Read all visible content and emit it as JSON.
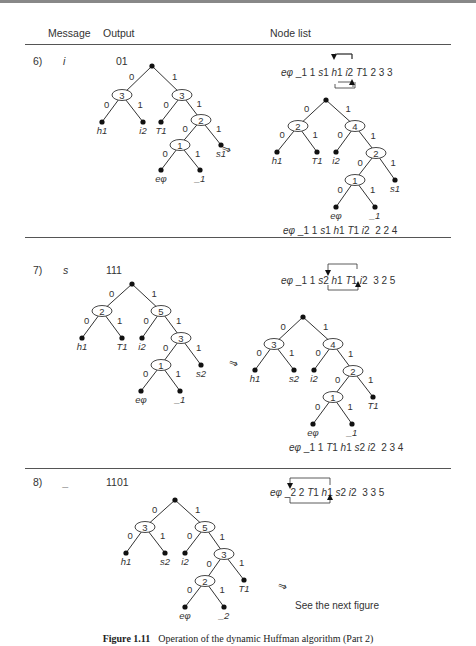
{
  "header": {
    "message": "Message",
    "output": "Output",
    "node_list": "Node list"
  },
  "steps": [
    {
      "number": "6)",
      "message": "i",
      "output": "01",
      "node_list_before": "eφ _1 1 s1 h1 i2 T1 2 3 3",
      "node_list_after": "eφ _1 1 s1 h1 T1 i2  2 2 4",
      "swap": [
        "i2",
        "T1"
      ],
      "tree_before": {
        "root": {
          "x": 152,
          "y": 66
        },
        "internal": [
          {
            "x": 122,
            "y": 95,
            "weight": "3"
          },
          {
            "x": 182,
            "y": 95,
            "weight": "3"
          },
          {
            "x": 201,
            "y": 120,
            "weight": "2"
          },
          {
            "x": 180,
            "y": 145,
            "weight": "1"
          }
        ],
        "leaves": [
          {
            "x": 102,
            "y": 122,
            "label": "h1"
          },
          {
            "x": 143,
            "y": 122,
            "label": "i2"
          },
          {
            "x": 161,
            "y": 122,
            "label": "T1"
          },
          {
            "x": 221,
            "y": 145,
            "label": "s1"
          },
          {
            "x": 161,
            "y": 170,
            "label": "eφ"
          },
          {
            "x": 200,
            "y": 170,
            "label": "_1"
          }
        ],
        "edges": [
          [
            152,
            66,
            122,
            95,
            "0"
          ],
          [
            152,
            66,
            182,
            95,
            "1"
          ],
          [
            122,
            95,
            102,
            122,
            "0"
          ],
          [
            122,
            95,
            143,
            122,
            "1"
          ],
          [
            182,
            95,
            161,
            122,
            "0"
          ],
          [
            182,
            95,
            201,
            120,
            "1"
          ],
          [
            201,
            120,
            180,
            145,
            "0"
          ],
          [
            201,
            120,
            221,
            145,
            "1"
          ],
          [
            180,
            145,
            161,
            170,
            "0"
          ],
          [
            180,
            145,
            200,
            170,
            "1"
          ]
        ]
      },
      "tree_after": {
        "root": {
          "x": 326,
          "y": 100
        },
        "internal": [
          {
            "x": 298,
            "y": 126,
            "weight": "2"
          },
          {
            "x": 355,
            "y": 126,
            "weight": "4"
          },
          {
            "x": 376,
            "y": 153,
            "weight": "2"
          },
          {
            "x": 355,
            "y": 180,
            "weight": "1"
          }
        ],
        "leaves": [
          {
            "x": 277,
            "y": 152,
            "label": "h1"
          },
          {
            "x": 317,
            "y": 152,
            "label": "T1"
          },
          {
            "x": 336,
            "y": 152,
            "label": "i2"
          },
          {
            "x": 395,
            "y": 180,
            "label": "s1"
          },
          {
            "x": 336,
            "y": 207,
            "label": "eφ"
          },
          {
            "x": 375,
            "y": 207,
            "label": "_1"
          }
        ],
        "edges": [
          [
            326,
            100,
            298,
            126,
            "0"
          ],
          [
            326,
            100,
            355,
            126,
            "1"
          ],
          [
            298,
            126,
            277,
            152,
            "0"
          ],
          [
            298,
            126,
            317,
            152,
            "1"
          ],
          [
            355,
            126,
            336,
            152,
            "0"
          ],
          [
            355,
            126,
            376,
            153,
            "1"
          ],
          [
            376,
            153,
            355,
            180,
            "0"
          ],
          [
            376,
            153,
            395,
            180,
            "1"
          ],
          [
            355,
            180,
            336,
            207,
            "0"
          ],
          [
            355,
            180,
            375,
            207,
            "1"
          ]
        ]
      }
    },
    {
      "number": "7)",
      "message": "s",
      "output": "111",
      "node_list_before": "eφ _1 1 s2 h1 T1 i2  3 2 5",
      "node_list_after": "eφ _1 1 T1 h1 s2 i2  2 3 4",
      "swap": [
        "s2",
        "T1"
      ],
      "tree_before": {
        "root": {
          "x": 132,
          "y": 284
        },
        "internal": [
          {
            "x": 102,
            "y": 311,
            "weight": "2"
          },
          {
            "x": 161,
            "y": 311,
            "weight": "5"
          },
          {
            "x": 181,
            "y": 338,
            "weight": "3"
          },
          {
            "x": 161,
            "y": 365,
            "weight": "1"
          }
        ],
        "leaves": [
          {
            "x": 82,
            "y": 338,
            "label": "h1"
          },
          {
            "x": 122,
            "y": 338,
            "label": "T1"
          },
          {
            "x": 142,
            "y": 338,
            "label": "i2"
          },
          {
            "x": 201,
            "y": 365,
            "label": "s2"
          },
          {
            "x": 141,
            "y": 391,
            "label": "eφ"
          },
          {
            "x": 180,
            "y": 391,
            "label": "_1"
          }
        ],
        "edges": [
          [
            132,
            284,
            102,
            311,
            "0"
          ],
          [
            132,
            284,
            161,
            311,
            "1"
          ],
          [
            102,
            311,
            82,
            338,
            "0"
          ],
          [
            102,
            311,
            122,
            338,
            "1"
          ],
          [
            161,
            311,
            142,
            338,
            "0"
          ],
          [
            161,
            311,
            181,
            338,
            "1"
          ],
          [
            181,
            338,
            161,
            365,
            "0"
          ],
          [
            181,
            338,
            201,
            365,
            "1"
          ],
          [
            161,
            365,
            141,
            391,
            "0"
          ],
          [
            161,
            365,
            180,
            391,
            "1"
          ]
        ]
      },
      "tree_after": {
        "root": {
          "x": 303,
          "y": 317
        },
        "internal": [
          {
            "x": 274,
            "y": 344,
            "weight": "3"
          },
          {
            "x": 333,
            "y": 344,
            "weight": "4"
          },
          {
            "x": 353,
            "y": 371,
            "weight": "2"
          },
          {
            "x": 333,
            "y": 397,
            "weight": "1"
          }
        ],
        "leaves": [
          {
            "x": 255,
            "y": 370,
            "label": "h1"
          },
          {
            "x": 294,
            "y": 370,
            "label": "s2"
          },
          {
            "x": 314,
            "y": 370,
            "label": "i2"
          },
          {
            "x": 373,
            "y": 397,
            "label": "T1"
          },
          {
            "x": 313,
            "y": 424,
            "label": "eφ"
          },
          {
            "x": 352,
            "y": 424,
            "label": "_1"
          }
        ],
        "edges": [
          [
            303,
            317,
            274,
            344,
            "0"
          ],
          [
            303,
            317,
            333,
            344,
            "1"
          ],
          [
            274,
            344,
            255,
            370,
            "0"
          ],
          [
            274,
            344,
            294,
            370,
            "1"
          ],
          [
            333,
            344,
            314,
            370,
            "0"
          ],
          [
            333,
            344,
            353,
            371,
            "1"
          ],
          [
            353,
            371,
            333,
            397,
            "0"
          ],
          [
            353,
            371,
            373,
            397,
            "1"
          ],
          [
            333,
            397,
            313,
            424,
            "0"
          ],
          [
            333,
            397,
            352,
            424,
            "1"
          ]
        ]
      }
    },
    {
      "number": "8)",
      "message": "_",
      "output": "1101",
      "node_list_before": "eφ _2 2 T1 h1 s2 i2  3 3 5",
      "swap": [
        "_2",
        "h1"
      ],
      "see_next": "See the next figure",
      "tree_before": {
        "root": {
          "x": 175,
          "y": 500
        },
        "internal": [
          {
            "x": 145,
            "y": 527,
            "weight": "3"
          },
          {
            "x": 205,
            "y": 527,
            "weight": "5"
          },
          {
            "x": 224,
            "y": 554,
            "weight": "3"
          },
          {
            "x": 205,
            "y": 581,
            "weight": "2"
          }
        ],
        "leaves": [
          {
            "x": 126,
            "y": 553,
            "label": "h1"
          },
          {
            "x": 165,
            "y": 553,
            "label": "s2"
          },
          {
            "x": 185,
            "y": 553,
            "label": "i2"
          },
          {
            "x": 244,
            "y": 580,
            "label": "T1"
          },
          {
            "x": 185,
            "y": 607,
            "label": "eφ"
          },
          {
            "x": 224,
            "y": 607,
            "label": "_2"
          }
        ],
        "edges": [
          [
            175,
            500,
            145,
            527,
            "0"
          ],
          [
            175,
            500,
            205,
            527,
            "1"
          ],
          [
            145,
            527,
            126,
            553,
            "0"
          ],
          [
            145,
            527,
            165,
            553,
            "1"
          ],
          [
            205,
            527,
            185,
            553,
            "0"
          ],
          [
            205,
            527,
            224,
            554,
            "1"
          ],
          [
            224,
            554,
            205,
            581,
            "0"
          ],
          [
            224,
            554,
            244,
            580,
            "1"
          ],
          [
            205,
            581,
            185,
            607,
            "0"
          ],
          [
            205,
            581,
            224,
            607,
            "1"
          ]
        ]
      }
    }
  ],
  "arrows": {
    "transform_glyph": "⇒"
  },
  "caption": {
    "label": "Figure 1.11",
    "text": "Operation of the dynamic Huffman algorithm (Part 2)"
  }
}
